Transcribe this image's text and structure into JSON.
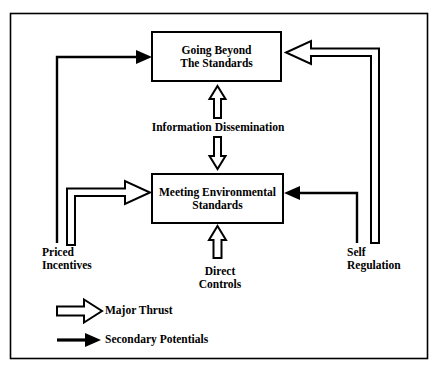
{
  "figure": {
    "type": "flow-diagram",
    "background_color": "#ffffff",
    "line_color": "#000000",
    "border": {
      "x": 10,
      "y": 13,
      "width": 418,
      "height": 346
    }
  },
  "nodes": [
    {
      "id": "going-beyond",
      "label": "Going Beyond\nThe Standards",
      "box": {
        "x": 152,
        "y": 32,
        "width": 129,
        "height": 49
      }
    },
    {
      "id": "meeting-standards",
      "label": "Meeting Environmental\nStandards",
      "box": {
        "x": 152,
        "y": 174,
        "width": 131,
        "height": 49
      }
    }
  ],
  "edge_labels": [
    {
      "id": "information-dissemination",
      "text": "Information Dissemination",
      "x": 218,
      "y": 127
    }
  ],
  "side_labels": [
    {
      "id": "priced-incentives",
      "text": "Priced\nIncentives",
      "x": 42,
      "y": 246,
      "align": "left"
    },
    {
      "id": "direct-controls",
      "text": "Direct\nControls",
      "x": 200,
      "y": 265,
      "align": "center"
    },
    {
      "id": "self-regulation",
      "text": "Self\nRegulation",
      "x": 347,
      "y": 246,
      "align": "left"
    }
  ],
  "connections": [
    {
      "id": "priced-incentives-to-going-beyond",
      "from": "priced-incentives",
      "to": "going-beyond",
      "style": "secondary-potentials",
      "arrow": "thin-solid"
    },
    {
      "id": "priced-incentives-to-meeting-standards",
      "from": "priced-incentives",
      "to": "meeting-standards",
      "style": "major-thrust",
      "arrow": "hollow-outline"
    },
    {
      "id": "self-regulation-to-going-beyond",
      "from": "self-regulation",
      "to": "going-beyond",
      "style": "major-thrust",
      "arrow": "hollow-outline"
    },
    {
      "id": "self-regulation-to-meeting-standards",
      "from": "self-regulation",
      "to": "meeting-standards",
      "style": "secondary-potentials",
      "arrow": "thin-solid"
    },
    {
      "id": "direct-controls-to-meeting-standards",
      "from": "direct-controls",
      "to": "meeting-standards",
      "style": "major-thrust",
      "arrow": "hollow-outline"
    },
    {
      "id": "information-dissemination-bidirectional",
      "from": "meeting-standards",
      "to": "going-beyond",
      "style": "major-thrust",
      "arrow": "hollow-double-headed"
    }
  ],
  "legend": {
    "items": [
      {
        "id": "major-thrust",
        "label": "Major Thrust",
        "arrow": "hollow-outline",
        "y": 311
      },
      {
        "id": "secondary-potentials",
        "label": "Secondary Potentials",
        "arrow": "thin-solid",
        "y": 340
      }
    ],
    "label_x": 105
  }
}
